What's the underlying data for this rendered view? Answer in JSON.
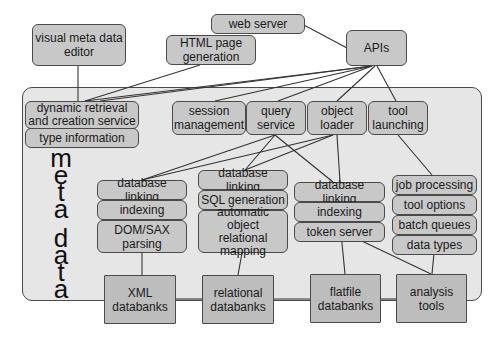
{
  "top": {
    "visual_editor": "visual meta data editor",
    "web_server": "web server",
    "html_generation": "HTML page generation",
    "apis": "APIs"
  },
  "meta_data": {
    "vertical_label_word1": [
      "m",
      "e",
      "t",
      "a"
    ],
    "vertical_label_word2": [
      "d",
      "a",
      "t",
      "a"
    ],
    "left_boxes": {
      "dynamic_retrieval": "dynamic retrieval and creation service",
      "type_information": "type information"
    },
    "services": [
      {
        "id": "session",
        "label": "session management"
      },
      {
        "id": "query",
        "label": "query service"
      },
      {
        "id": "object_loader",
        "label": "object loader"
      },
      {
        "id": "tool_launching",
        "label": "tool launching"
      }
    ],
    "columns": {
      "xml": [
        "database linking",
        "indexing",
        "DOM/SAX parsing"
      ],
      "relational": [
        "database linking",
        "SQL generation",
        "automatic object relational mapping"
      ],
      "flatfile": [
        "database linking",
        "indexing",
        "token server"
      ],
      "tools": [
        "job processing",
        "tool options",
        "batch queues",
        "data types"
      ]
    }
  },
  "backends": {
    "xml": "XML databanks",
    "relational": "relational databanks",
    "flatfile": "flatfile databanks",
    "analysis": "analysis tools"
  },
  "colors": {
    "box_fill": "#c8c8c8",
    "backend_fill": "#bdbdbd",
    "container_fill": "#e6e6e6",
    "stroke": "#4a4a4a"
  }
}
